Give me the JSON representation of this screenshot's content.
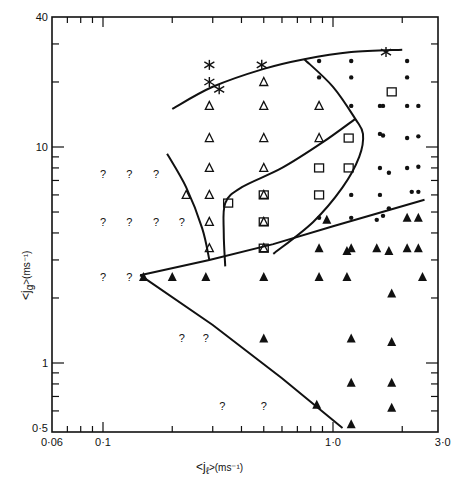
{
  "chart_data": {
    "type": "scatter",
    "title": "",
    "xlabel": "<j_l> (ms^-1)",
    "ylabel": "<j_g> (ms^-1)",
    "xscale": "log",
    "yscale": "log",
    "xlim": [
      0.06,
      3.0
    ],
    "ylim": [
      0.5,
      40
    ],
    "x_tick_labels": [
      "0·06",
      "0·1",
      "1·0",
      "3·0"
    ],
    "y_tick_labels": [
      "0·5",
      "1",
      "10",
      "40"
    ],
    "grid": false,
    "legend": null,
    "series": [
      {
        "name": "asterisk",
        "marker": "*",
        "points": [
          [
            0.29,
            24.0
          ],
          [
            0.29,
            20.0
          ],
          [
            0.32,
            18.5
          ],
          [
            0.49,
            24.0
          ],
          [
            1.7,
            27.5
          ]
        ]
      },
      {
        "name": "open-triangle",
        "marker": "△",
        "points": [
          [
            0.29,
            15.5
          ],
          [
            0.29,
            11.0
          ],
          [
            0.29,
            8.0
          ],
          [
            0.29,
            6.0
          ],
          [
            0.29,
            4.5
          ],
          [
            0.29,
            3.4
          ],
          [
            0.23,
            6.0
          ],
          [
            0.5,
            20.0
          ],
          [
            0.5,
            15.5
          ],
          [
            0.5,
            11.0
          ],
          [
            0.5,
            8.0
          ],
          [
            0.5,
            6.0
          ],
          [
            0.5,
            4.5
          ],
          [
            0.5,
            3.4
          ],
          [
            0.87,
            15.5
          ],
          [
            0.87,
            11.0
          ]
        ]
      },
      {
        "name": "open-square",
        "marker": "□",
        "points": [
          [
            0.35,
            5.5
          ],
          [
            0.5,
            6.0
          ],
          [
            0.5,
            4.5
          ],
          [
            0.5,
            3.4
          ],
          [
            0.87,
            8.0
          ],
          [
            0.87,
            6.0
          ],
          [
            1.17,
            11.0
          ],
          [
            1.17,
            8.0
          ],
          [
            1.8,
            18.0
          ]
        ]
      },
      {
        "name": "filled-dot",
        "marker": "•",
        "points": [
          [
            0.87,
            25.0
          ],
          [
            1.2,
            25.0
          ],
          [
            2.1,
            25.0
          ],
          [
            0.87,
            21.0
          ],
          [
            1.2,
            21.0
          ],
          [
            2.1,
            21.0
          ],
          [
            1.2,
            15.5
          ],
          [
            1.6,
            15.5
          ],
          [
            1.65,
            15.5
          ],
          [
            2.1,
            15.5
          ],
          [
            2.35,
            15.5
          ],
          [
            1.6,
            11.5
          ],
          [
            1.65,
            11.3
          ],
          [
            2.1,
            11.0
          ],
          [
            2.35,
            11.2
          ],
          [
            1.6,
            8.0
          ],
          [
            1.75,
            7.6
          ],
          [
            2.1,
            8.0
          ],
          [
            2.35,
            8.1
          ],
          [
            1.2,
            6.0
          ],
          [
            1.6,
            6.0
          ],
          [
            2.2,
            6.2
          ],
          [
            2.35,
            6.2
          ],
          [
            0.87,
            4.7
          ],
          [
            1.2,
            4.7
          ],
          [
            1.55,
            4.6
          ],
          [
            1.65,
            4.8
          ],
          [
            1.75,
            5.2
          ]
        ]
      },
      {
        "name": "filled-triangle",
        "marker": "▲",
        "points": [
          [
            0.94,
            4.6
          ],
          [
            2.1,
            4.7
          ],
          [
            2.35,
            4.7
          ],
          [
            0.87,
            3.4
          ],
          [
            1.15,
            3.3
          ],
          [
            1.2,
            3.4
          ],
          [
            1.55,
            3.4
          ],
          [
            1.75,
            3.3
          ],
          [
            2.1,
            3.4
          ],
          [
            2.35,
            3.4
          ],
          [
            0.15,
            2.5
          ],
          [
            0.2,
            2.5
          ],
          [
            0.28,
            2.5
          ],
          [
            0.5,
            2.5
          ],
          [
            0.87,
            2.5
          ],
          [
            1.15,
            2.5
          ],
          [
            2.45,
            2.5
          ],
          [
            1.8,
            2.1
          ],
          [
            0.5,
            1.3
          ],
          [
            1.2,
            1.3
          ],
          [
            1.8,
            1.25
          ],
          [
            1.2,
            0.81
          ],
          [
            1.8,
            0.81
          ],
          [
            0.85,
            0.64
          ],
          [
            1.8,
            0.62
          ],
          [
            1.2,
            0.52
          ]
        ]
      },
      {
        "name": "uncertain",
        "marker": "?",
        "points": [
          [
            0.1,
            7.5
          ],
          [
            0.13,
            7.5
          ],
          [
            0.17,
            7.5
          ],
          [
            0.1,
            4.5
          ],
          [
            0.13,
            4.5
          ],
          [
            0.17,
            4.5
          ],
          [
            0.22,
            4.5
          ],
          [
            0.1,
            2.5
          ],
          [
            0.13,
            2.5
          ],
          [
            0.22,
            1.3
          ],
          [
            0.28,
            1.3
          ],
          [
            0.33,
            0.63
          ],
          [
            0.5,
            0.63
          ]
        ]
      }
    ],
    "boundaries": [
      {
        "name": "upper-boundary",
        "points": [
          [
            0.2,
            15.0
          ],
          [
            0.3,
            19.0
          ],
          [
            0.5,
            23.0
          ],
          [
            0.75,
            25.5
          ],
          [
            1.2,
            27.5
          ],
          [
            2.0,
            28.2
          ]
        ]
      },
      {
        "name": "diagonal-right",
        "points": [
          [
            0.75,
            25.5
          ],
          [
            1.0,
            19.0
          ],
          [
            1.25,
            13.5
          ],
          [
            1.35,
            11.5
          ],
          [
            1.3,
            9.0
          ],
          [
            1.1,
            6.5
          ],
          [
            0.82,
            4.5
          ],
          [
            0.55,
            3.2
          ]
        ]
      },
      {
        "name": "inner-curve",
        "points": [
          [
            1.25,
            13.5
          ],
          [
            0.9,
            10.5
          ],
          [
            0.6,
            8.0
          ],
          [
            0.4,
            6.5
          ],
          [
            0.34,
            5.5
          ],
          [
            0.335,
            4.0
          ],
          [
            0.34,
            2.8
          ]
        ]
      },
      {
        "name": "left-curve",
        "points": [
          [
            0.19,
            9.3
          ],
          [
            0.23,
            6.5
          ],
          [
            0.27,
            4.2
          ],
          [
            0.29,
            3.0
          ]
        ]
      },
      {
        "name": "wedge-upper",
        "points": [
          [
            0.145,
            2.55
          ],
          [
            0.29,
            3.0
          ],
          [
            0.55,
            3.55
          ],
          [
            1.0,
            4.3
          ],
          [
            2.5,
            5.7
          ]
        ]
      },
      {
        "name": "wedge-lower",
        "points": [
          [
            0.145,
            2.55
          ],
          [
            0.3,
            1.5
          ],
          [
            0.6,
            0.85
          ],
          [
            1.1,
            0.5
          ]
        ]
      }
    ]
  },
  "axes": {
    "x_title_main": "<j",
    "x_title_sub": "ℓ",
    "x_title_units": ">(ms⁻¹)",
    "y_title_main": "<j",
    "y_title_sub": "g",
    "y_title_units": ">(ms⁻¹)"
  }
}
